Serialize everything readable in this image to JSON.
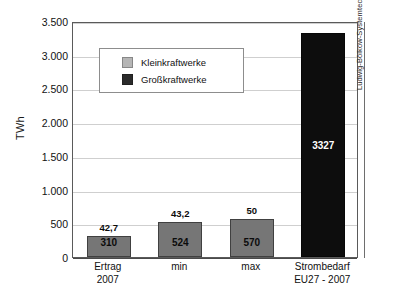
{
  "chart_data": {
    "type": "bar",
    "title": "",
    "subtitle": "",
    "xlabel": "",
    "ylabel": "TWh",
    "ylim": [
      0,
      3500
    ],
    "ytick_values": [
      0,
      500,
      1000,
      1500,
      2000,
      2500,
      3000,
      3500
    ],
    "ytick_labels": [
      "0",
      "500",
      "1.000",
      "1.500",
      "2.000",
      "2.500",
      "3.000",
      "3.500"
    ],
    "grid": true,
    "legend_position": "upper-left-inside",
    "categories": [
      "Ertrag\n2007",
      "min",
      "max",
      "Strombedarf\nEU27 - 2007"
    ],
    "category_lines": [
      [
        "Ertrag",
        "2007"
      ],
      [
        "min"
      ],
      [
        "max"
      ],
      [
        "Strombedarf",
        "EU27 - 2007"
      ]
    ],
    "values": [
      310,
      524,
      570,
      3327
    ],
    "bar_value_labels": [
      "310",
      "524",
      "570",
      "3327"
    ],
    "bar_top_annotations": [
      "42,7",
      "43,2",
      "50",
      ""
    ],
    "bar_series_kind": [
      "Kleinkraftwerke",
      "Kleinkraftwerke",
      "Kleinkraftwerke",
      "Großkraftwerke"
    ],
    "legend": [
      {
        "label": "Kleinkraftwerke",
        "color": "#b5b5b5"
      },
      {
        "label": "Großkraftwerke",
        "color": "#2b2b2b"
      }
    ],
    "bar_colors": [
      "#767676",
      "#767676",
      "#767676",
      "#0d0d0d"
    ],
    "bar_label_colors": [
      "#0b0b0b",
      "#0b0b0b",
      "#0b0b0b",
      "#ffffff"
    ],
    "annotations": [
      {
        "text": "Ludwig-Bölkow-Systemtechnik GmbH, 2010",
        "position": "right-margin-rotated"
      }
    ]
  },
  "credit": {
    "text": "Ludwig-Bölkow-Systemtechnik GmbH, 2010"
  }
}
